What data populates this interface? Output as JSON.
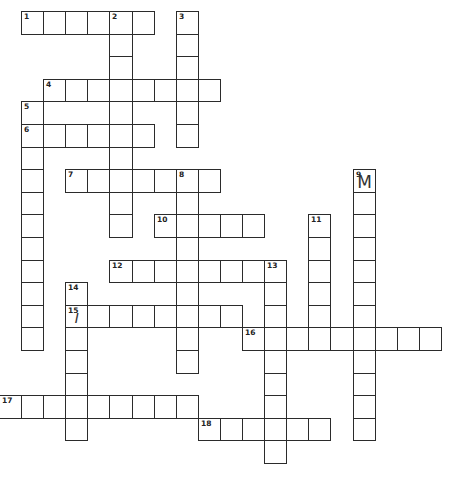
{
  "puzzle": {
    "layout": {
      "origin_x": 21,
      "origin_y": 11,
      "pitch_x": 22.1,
      "pitch_y": 22.6
    },
    "words": [
      {
        "number": "1",
        "dir": "across",
        "col": 1,
        "row": 1,
        "length": 6
      },
      {
        "number": "2",
        "dir": "down",
        "col": 5,
        "row": 1,
        "length": 10
      },
      {
        "number": "3",
        "dir": "down",
        "col": 8,
        "row": 1,
        "length": 6
      },
      {
        "number": "4",
        "dir": "across",
        "col": 2,
        "row": 4,
        "length": 8
      },
      {
        "number": "5",
        "dir": "down",
        "col": 1,
        "row": 5,
        "length": 11
      },
      {
        "number": "6",
        "dir": "across",
        "col": 1,
        "row": 6,
        "length": 6
      },
      {
        "number": "7",
        "dir": "across",
        "col": 3,
        "row": 8,
        "length": 7
      },
      {
        "number": "8",
        "dir": "down",
        "col": 8,
        "row": 8,
        "length": 9
      },
      {
        "number": "9",
        "dir": "down",
        "col": 16,
        "row": 8,
        "length": 12
      },
      {
        "number": "10",
        "dir": "across",
        "col": 7,
        "row": 10,
        "length": 5
      },
      {
        "number": "11",
        "dir": "down",
        "col": 14,
        "row": 10,
        "length": 6
      },
      {
        "number": "12",
        "dir": "across",
        "col": 5,
        "row": 12,
        "length": 8
      },
      {
        "number": "13",
        "dir": "down",
        "col": 12,
        "row": 12,
        "length": 9
      },
      {
        "number": "14",
        "dir": "down",
        "col": 3,
        "row": 13,
        "length": 7
      },
      {
        "number": "15",
        "dir": "across",
        "col": 3,
        "row": 14,
        "length": 8
      },
      {
        "number": "16",
        "dir": "across",
        "col": 11,
        "row": 15,
        "length": 9
      },
      {
        "number": "17",
        "dir": "across",
        "col": 0,
        "row": 18,
        "length": 9
      },
      {
        "number": "18",
        "dir": "across",
        "col": 9,
        "row": 19,
        "length": 6
      }
    ],
    "filled_letters": [
      {
        "col": 16,
        "row": 8,
        "letter": "M",
        "style": "handwritten"
      },
      {
        "col": 3,
        "row": 14,
        "letter": "I",
        "style": "handwritten-slant"
      }
    ]
  }
}
